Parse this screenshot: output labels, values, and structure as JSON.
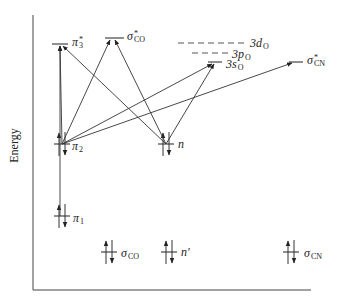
{
  "axis": {
    "y_label": "Energy"
  },
  "levels": [
    {
      "id": "pi3_star",
      "symbol": "π",
      "sub": "3",
      "sup": "*",
      "x1": 52,
      "x2": 68,
      "y": 44,
      "lx": 72,
      "ly": 36,
      "dashed": false,
      "occupied": false
    },
    {
      "id": "sigma_co_star",
      "symbol": "σ",
      "sub": "CO",
      "sup": "*",
      "x1": 105,
      "x2": 124,
      "y": 38,
      "lx": 127,
      "ly": 30,
      "dashed": false,
      "occupied": false
    },
    {
      "id": "3d_o",
      "symbol": "3d",
      "sub": "O",
      "sup": "",
      "x1": 178,
      "x2": 247,
      "y": 43,
      "lx": 250,
      "ly": 37,
      "dashed": true,
      "occupied": false
    },
    {
      "id": "3p_o",
      "symbol": "3p",
      "sub": "O",
      "sup": "",
      "x1": 192,
      "x2": 229,
      "y": 53,
      "lx": 232,
      "ly": 48,
      "dashed": true,
      "occupied": false
    },
    {
      "id": "3s_o",
      "symbol": "3s",
      "sub": "O",
      "sup": "",
      "x1": 208,
      "x2": 222,
      "y": 62,
      "lx": 226,
      "ly": 58,
      "dashed": false,
      "occupied": false
    },
    {
      "id": "sigma_cn_star",
      "symbol": "σ",
      "sub": "CN",
      "sup": "*",
      "x1": 289,
      "x2": 303,
      "y": 62,
      "lx": 307,
      "ly": 54,
      "dashed": false,
      "occupied": false
    },
    {
      "id": "pi2",
      "symbol": "π",
      "sub": "2",
      "sup": "",
      "x1": 54,
      "x2": 70,
      "y": 144,
      "lx": 72,
      "ly": 140,
      "dashed": false,
      "occupied": true
    },
    {
      "id": "n",
      "symbol": "n",
      "sub": "",
      "sup": "",
      "x1": 158,
      "x2": 174,
      "y": 144,
      "lx": 178,
      "ly": 138,
      "dashed": false,
      "occupied": true
    },
    {
      "id": "pi1",
      "symbol": "π",
      "sub": "1",
      "sup": "",
      "x1": 54,
      "x2": 70,
      "y": 216,
      "lx": 73,
      "ly": 212,
      "dashed": false,
      "occupied": true
    },
    {
      "id": "sigma_co",
      "symbol": "σ",
      "sub": "CO",
      "sup": "",
      "x1": 101,
      "x2": 117,
      "y": 252,
      "lx": 121,
      "ly": 247,
      "dashed": false,
      "occupied": true
    },
    {
      "id": "n_prime",
      "symbol": "n′",
      "sub": "",
      "sup": "",
      "x1": 161,
      "x2": 177,
      "y": 252,
      "lx": 181,
      "ly": 246,
      "dashed": false,
      "occupied": true
    },
    {
      "id": "sigma_cn",
      "symbol": "σ",
      "sub": "CN",
      "sup": "",
      "x1": 283,
      "x2": 299,
      "y": 252,
      "lx": 304,
      "ly": 247,
      "dashed": false,
      "occupied": true
    }
  ],
  "transitions": [
    {
      "from": "pi2",
      "to": "pi3_star",
      "x1": 62,
      "y1": 144,
      "x2": 60,
      "y2": 46
    },
    {
      "from": "pi1",
      "to": "pi3_star",
      "x1": 60,
      "y1": 216,
      "x2": 60,
      "y2": 46
    },
    {
      "from": "pi2",
      "to": "sigma_co_star",
      "x1": 62,
      "y1": 144,
      "x2": 110,
      "y2": 40
    },
    {
      "from": "pi2",
      "to": "3s_o",
      "x1": 62,
      "y1": 144,
      "x2": 212,
      "y2": 64
    },
    {
      "from": "pi2",
      "to": "sigma_cn_star",
      "x1": 62,
      "y1": 144,
      "x2": 292,
      "y2": 63
    },
    {
      "from": "n",
      "to": "pi3_star",
      "x1": 166,
      "y1": 144,
      "x2": 63,
      "y2": 46
    },
    {
      "from": "n",
      "to": "sigma_co_star",
      "x1": 166,
      "y1": 144,
      "x2": 115,
      "y2": 40
    },
    {
      "from": "n",
      "to": "3s_o",
      "x1": 166,
      "y1": 144,
      "x2": 214,
      "y2": 64
    }
  ],
  "colors": {
    "line": "#333333",
    "dash": "#555555",
    "background": "#ffffff"
  }
}
